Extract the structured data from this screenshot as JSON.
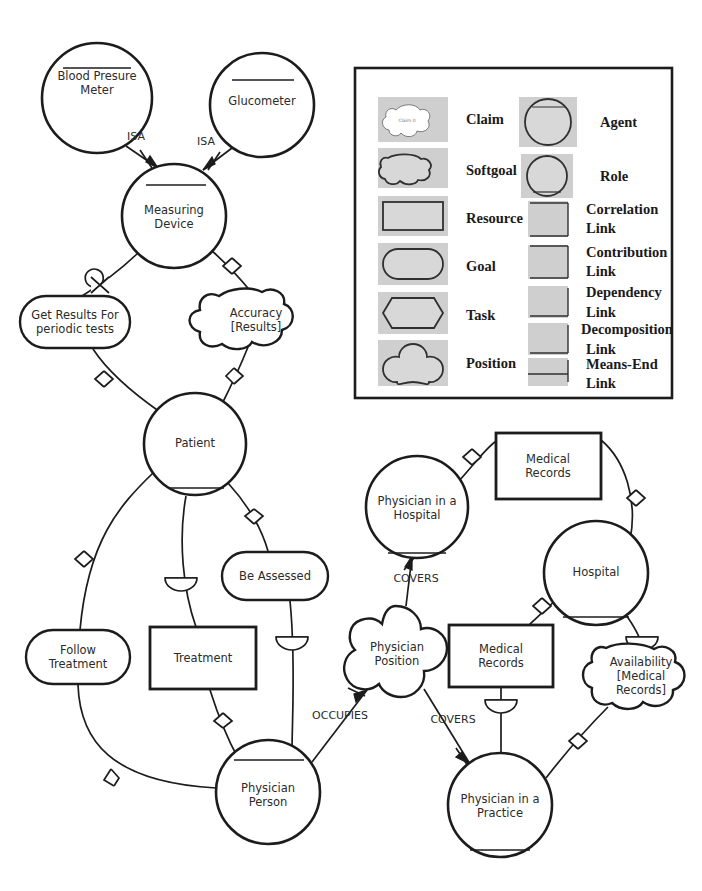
{
  "diagram": {
    "background_color": "#ffffff",
    "stroke_color": "#1c1c1c",
    "nodes": [
      {
        "id": "blood_pressure_meter",
        "label": "Blood Presure\nMeter",
        "lines": [
          "Blood Presure",
          "Meter"
        ],
        "type": "agent",
        "cx": 97,
        "cy": 98,
        "rx": 55,
        "ry": 55
      },
      {
        "id": "glucometer",
        "label": "Glucometer",
        "lines": [
          "Glucometer"
        ],
        "type": "agent",
        "cx": 262,
        "cy": 105,
        "rx": 52,
        "ry": 52
      },
      {
        "id": "measuring_device",
        "label": "Measuring\nDevice",
        "lines": [
          "Measuring",
          "Device"
        ],
        "type": "agent",
        "cx": 174,
        "cy": 216,
        "rx": 52,
        "ry": 52
      },
      {
        "id": "get_results",
        "label": "Get Results For\nperiodic tests",
        "lines": [
          "Get Results For",
          "periodic tests"
        ],
        "type": "goal",
        "cx": 75,
        "cy": 322,
        "w": 110,
        "h": 52
      },
      {
        "id": "accuracy_results",
        "label": "Accuracy\n[Results]",
        "lines": [
          "Accuracy",
          "[Results]"
        ],
        "type": "softgoal",
        "cx": 256,
        "cy": 319,
        "w": 100,
        "h": 52
      },
      {
        "id": "patient",
        "label": "Patient",
        "lines": [
          "Patient"
        ],
        "type": "role",
        "cx": 195,
        "cy": 444,
        "rx": 51,
        "ry": 51
      },
      {
        "id": "be_assessed",
        "label": "Be Assessed",
        "lines": [
          "Be Assessed"
        ],
        "type": "goal",
        "cx": 275,
        "cy": 576,
        "w": 106,
        "h": 48
      },
      {
        "id": "follow_treatment",
        "label": "Follow\nTreatment",
        "lines": [
          "Follow",
          "Treatment"
        ],
        "type": "goal",
        "cx": 78,
        "cy": 657,
        "w": 104,
        "h": 54
      },
      {
        "id": "treatment",
        "label": "Treatment",
        "lines": [
          "Treatment"
        ],
        "type": "resource",
        "cx": 203,
        "cy": 658,
        "w": 106,
        "h": 62
      },
      {
        "id": "physician_person",
        "label": "Physician\nPerson",
        "lines": [
          "Physician",
          "Person"
        ],
        "type": "agent",
        "cx": 268,
        "cy": 792,
        "rx": 52,
        "ry": 52
      },
      {
        "id": "physician_position",
        "label": "Physician\nPosition",
        "lines": [
          "Physician",
          "Position"
        ],
        "type": "position",
        "cx": 396,
        "cy": 654,
        "rx": 49,
        "ry": 49
      },
      {
        "id": "physician_hospital",
        "label": "Physician in a\nHospital",
        "lines": [
          "Physician in a",
          "Hospital"
        ],
        "type": "role",
        "cx": 417,
        "cy": 507,
        "rx": 51,
        "ry": 51
      },
      {
        "id": "medical_records_top",
        "label": "Medical\nRecords",
        "lines": [
          "Medical",
          "Records"
        ],
        "type": "resource",
        "cx": 548,
        "cy": 466,
        "w": 105,
        "h": 66
      },
      {
        "id": "hospital",
        "label": "Hospital",
        "lines": [
          "Hospital"
        ],
        "type": "agent",
        "cx": 596,
        "cy": 573,
        "rx": 52,
        "ry": 52
      },
      {
        "id": "medical_records_bottom",
        "label": "Medical\nRecords",
        "lines": [
          "Medical",
          "Records"
        ],
        "type": "resource",
        "cx": 501,
        "cy": 656,
        "w": 104,
        "h": 62
      },
      {
        "id": "availability_medical_records",
        "label": "Availability\n[Medical\nRecords]",
        "lines": [
          "Availability",
          "[Medical",
          "Records]"
        ],
        "type": "softgoal",
        "cx": 641,
        "cy": 676,
        "w": 98,
        "h": 64
      },
      {
        "id": "physician_practice",
        "label": "Physician in a\nPractice",
        "lines": [
          "Physician in a",
          "Practice"
        ],
        "type": "role",
        "cx": 500,
        "cy": 805,
        "rx": 52,
        "ry": 52
      }
    ],
    "edge_labels": [
      {
        "id": "isa_left",
        "text": "ISA",
        "x": 136,
        "y": 136
      },
      {
        "id": "isa_right",
        "text": "ISA",
        "x": 206,
        "y": 141
      },
      {
        "id": "covers_hospital",
        "text": "COVERS",
        "x": 416,
        "y": 578
      },
      {
        "id": "occupies",
        "text": "OCCUPIES",
        "x": 340,
        "y": 715
      },
      {
        "id": "covers_practice",
        "text": "COVERS",
        "x": 453,
        "y": 719
      }
    ]
  },
  "legend": {
    "name": "legend-box",
    "box": {
      "x": 355,
      "y": 68,
      "w": 317,
      "h": 330
    },
    "claim_inner_text": "Claim 0",
    "left_column": [
      {
        "id": "claim",
        "label": "Claim",
        "shape": "claim"
      },
      {
        "id": "softgoal",
        "label": "Softgoal",
        "shape": "softgoal"
      },
      {
        "id": "resource",
        "label": "Resource",
        "shape": "resource"
      },
      {
        "id": "goal",
        "label": "Goal",
        "shape": "goal"
      },
      {
        "id": "task",
        "label": "Task",
        "shape": "task"
      },
      {
        "id": "position",
        "label": "Position",
        "shape": "position"
      }
    ],
    "right_column": [
      {
        "id": "agent",
        "label": "Agent",
        "shape": "agent"
      },
      {
        "id": "role",
        "label": "Role",
        "shape": "role"
      },
      {
        "id": "correlation_link",
        "label": "Correlation\nLink",
        "lines": [
          "Correlation",
          "Link"
        ],
        "shape": "link"
      },
      {
        "id": "contribution_link",
        "label": "Contribution\nLink",
        "lines": [
          "Contribution",
          "Link"
        ],
        "shape": "link"
      },
      {
        "id": "dependency_link",
        "label": "Dependency\nLink",
        "lines": [
          "Dependency",
          "Link"
        ],
        "shape": "link"
      },
      {
        "id": "decomposition_link",
        "label": "Decomposition\nLink",
        "lines": [
          "Decomposition",
          "Link"
        ],
        "shape": "link"
      },
      {
        "id": "means_end_link",
        "label": "Means-End\nLink",
        "lines": [
          "Means-End",
          "Link"
        ],
        "shape": "link"
      }
    ]
  }
}
